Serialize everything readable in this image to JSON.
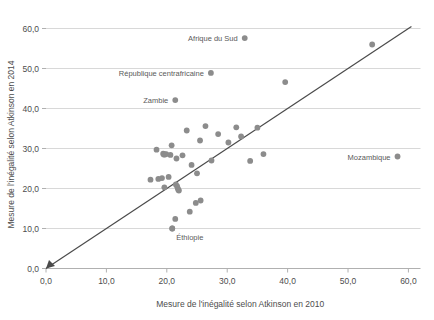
{
  "chart_data": {
    "type": "scatter",
    "title": "",
    "xlabel": "Mesure de l'inégalité selon Atkinson en 2010",
    "ylabel": "Mesure de l'inégalité selon Atkinson en 2014",
    "xlim": [
      0,
      62
    ],
    "ylim": [
      0,
      62
    ],
    "xticks": [
      "0,0",
      "10,0",
      "20,0",
      "30,0",
      "40,0",
      "50,0",
      "60,0"
    ],
    "xtickvalues": [
      0,
      10,
      20,
      30,
      40,
      50,
      60
    ],
    "yticks": [
      "0,0",
      "10,0",
      "20,0",
      "30,0",
      "40,0",
      "50,0",
      "60,0"
    ],
    "ytickvalues": [
      0,
      10,
      20,
      30,
      40,
      50,
      60
    ],
    "grid": "horizontal",
    "legend": "none",
    "point_color": "#8c8c8c",
    "line_color": "#4a4a4a",
    "grid_color": "#d8d8d8",
    "axis_color": "#b0b0b0",
    "reference_line": {
      "name": "ligne-45-degres",
      "from": [
        0,
        0
      ],
      "to": [
        60.5,
        60.5
      ],
      "arrow_at": [
        0,
        0
      ]
    },
    "points": [
      {
        "x": 17.3,
        "y": 22.2
      },
      {
        "x": 18.3,
        "y": 29.7
      },
      {
        "x": 18.6,
        "y": 22.4
      },
      {
        "x": 19.2,
        "y": 22.6
      },
      {
        "x": 19.4,
        "y": 28.7
      },
      {
        "x": 19.5,
        "y": 28.5
      },
      {
        "x": 19.7,
        "y": 28.5
      },
      {
        "x": 19.9,
        "y": 28.6
      },
      {
        "x": 19.6,
        "y": 20.3
      },
      {
        "x": 20.3,
        "y": 22.9
      },
      {
        "x": 20.6,
        "y": 28.4
      },
      {
        "x": 20.8,
        "y": 30.8
      },
      {
        "x": 20.9,
        "y": 10.0
      },
      {
        "x": 21.4,
        "y": 12.4
      },
      {
        "x": 21.5,
        "y": 21.0
      },
      {
        "x": 21.7,
        "y": 20.6
      },
      {
        "x": 21.8,
        "y": 20.1
      },
      {
        "x": 21.9,
        "y": 19.7
      },
      {
        "x": 22.0,
        "y": 19.5
      },
      {
        "x": 21.6,
        "y": 27.5
      },
      {
        "x": 22.6,
        "y": 28.3
      },
      {
        "x": 23.3,
        "y": 34.5
      },
      {
        "x": 23.8,
        "y": 14.2
      },
      {
        "x": 24.1,
        "y": 25.9
      },
      {
        "x": 24.8,
        "y": 16.4
      },
      {
        "x": 25.0,
        "y": 23.8
      },
      {
        "x": 25.6,
        "y": 17.0
      },
      {
        "x": 25.5,
        "y": 32.0
      },
      {
        "x": 26.4,
        "y": 35.6
      },
      {
        "x": 27.4,
        "y": 27.0
      },
      {
        "x": 28.5,
        "y": 33.6
      },
      {
        "x": 30.2,
        "y": 31.5
      },
      {
        "x": 31.5,
        "y": 35.3
      },
      {
        "x": 32.3,
        "y": 33.0
      },
      {
        "x": 33.8,
        "y": 26.9
      },
      {
        "x": 35.0,
        "y": 35.2
      },
      {
        "x": 36.0,
        "y": 28.6
      },
      {
        "x": 39.6,
        "y": 46.6
      },
      {
        "x": 54.0,
        "y": 56.0
      }
    ],
    "labeled_points": [
      {
        "label": "Afrique du Sud",
        "x": 32.9,
        "y": 57.6,
        "label_side": "left"
      },
      {
        "label": "République centrafricaine",
        "x": 27.3,
        "y": 48.9,
        "label_side": "left"
      },
      {
        "label": "Zambie",
        "x": 21.4,
        "y": 42.1,
        "label_side": "left"
      },
      {
        "label": "Mozambique",
        "x": 58.2,
        "y": 28.0,
        "label_side": "left"
      },
      {
        "label": "Éthiopie",
        "x": 20.9,
        "y": 10.0,
        "label_side": "below"
      }
    ]
  }
}
